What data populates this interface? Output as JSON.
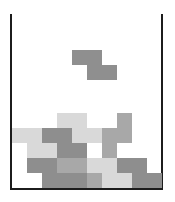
{
  "game": {
    "name": "tetris-board",
    "grid": {
      "columns": 10,
      "cell_size_px": 15,
      "origin_x": 12,
      "origin_y": 113
    },
    "colors": {
      "L": "#d9d9d9",
      "M": "#a8a8a8",
      "D": "#8e8e8e",
      "active": "#8f8f8f",
      "wall": "#1c1c1c"
    },
    "active_piece": {
      "type": "Z",
      "cells": [
        {
          "x": 72,
          "y": 50
        },
        {
          "x": 87,
          "y": 50
        },
        {
          "x": 87,
          "y": 65
        },
        {
          "x": 102,
          "y": 65
        }
      ]
    },
    "stack": [
      [
        "",
        "",
        "",
        "L",
        "L",
        "",
        "",
        "M",
        "",
        ""
      ],
      [
        "L",
        "L",
        "D",
        "D",
        "L",
        "L",
        "M",
        "M",
        "",
        ""
      ],
      [
        "",
        "L",
        "L",
        "D",
        "D",
        "",
        "M",
        "",
        "",
        ""
      ],
      [
        "",
        "D",
        "D",
        "M",
        "M",
        "L",
        "L",
        "D",
        "D",
        ""
      ],
      [
        "",
        "",
        "D",
        "D",
        "D",
        "M",
        "L",
        "L",
        "D",
        "D"
      ]
    ]
  }
}
